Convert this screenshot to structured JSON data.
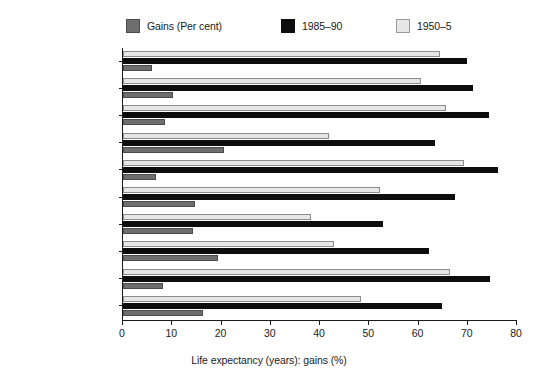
{
  "chart_data": {
    "type": "bar",
    "orientation": "horizontal",
    "title": "",
    "xlabel": "Life expectancy (years): gains (%)",
    "ylabel": "",
    "xlim": [
      0,
      80
    ],
    "xticks": [
      0,
      10,
      20,
      30,
      40,
      50,
      60,
      70,
      80
    ],
    "grid": false,
    "legend_position": "top",
    "categories": [
      "USSR",
      "Oceania",
      "Europe",
      "Asia",
      "North America",
      "Latin America",
      "Africa",
      "Less developed countries",
      "More developed countries",
      "World"
    ],
    "series": [
      {
        "name": "1950-5",
        "label": "1950–5",
        "color": "#e6e6e6",
        "values": [
          64.4,
          60.6,
          65.6,
          41.9,
          69.3,
          52.2,
          38.2,
          42.8,
          66.4,
          48.4
        ]
      },
      {
        "name": "1985-90",
        "label": "1985–90",
        "color": "#0d0d0d",
        "values": [
          69.8,
          71.0,
          74.3,
          63.4,
          76.1,
          67.4,
          52.7,
          62.1,
          74.5,
          64.8
        ]
      },
      {
        "name": "Gains (Per cent)",
        "label": "Gains (Per cent)",
        "color": "#6e6e6e",
        "values": [
          5.8,
          10.2,
          8.6,
          20.5,
          6.8,
          14.6,
          14.2,
          19.2,
          8.1,
          16.3
        ]
      }
    ]
  },
  "legend": {
    "items": [
      {
        "label": "Gains (Per cent)",
        "color": "#6e6e6e"
      },
      {
        "label": "1985–90",
        "color": "#0d0d0d"
      },
      {
        "label": "1950–5",
        "color": "#e6e6e6"
      }
    ]
  },
  "axis": {
    "x_title": "Life expectancy (years): gains (%)",
    "x_tick_labels": [
      "0",
      "10",
      "20",
      "30",
      "40",
      "50",
      "60",
      "70",
      "80"
    ]
  }
}
